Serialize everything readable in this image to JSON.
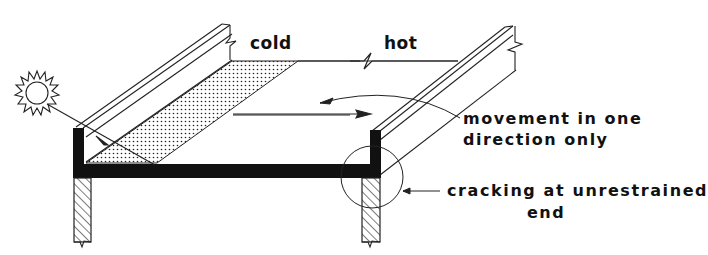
{
  "diagram": {
    "type": "technical-section-diagram",
    "labels": {
      "cold": "cold",
      "hot": "hot",
      "movement_line1": "movement in one",
      "movement_line2": "direction only",
      "cracking_line1": "cracking at unrestrained",
      "cracking_line2": "end"
    },
    "icons": [
      "sun-icon",
      "double-arrow-icon",
      "curved-arrow-icon",
      "callout-circle-icon"
    ],
    "colors": {
      "ink": "#111111",
      "background": "#ffffff"
    }
  }
}
